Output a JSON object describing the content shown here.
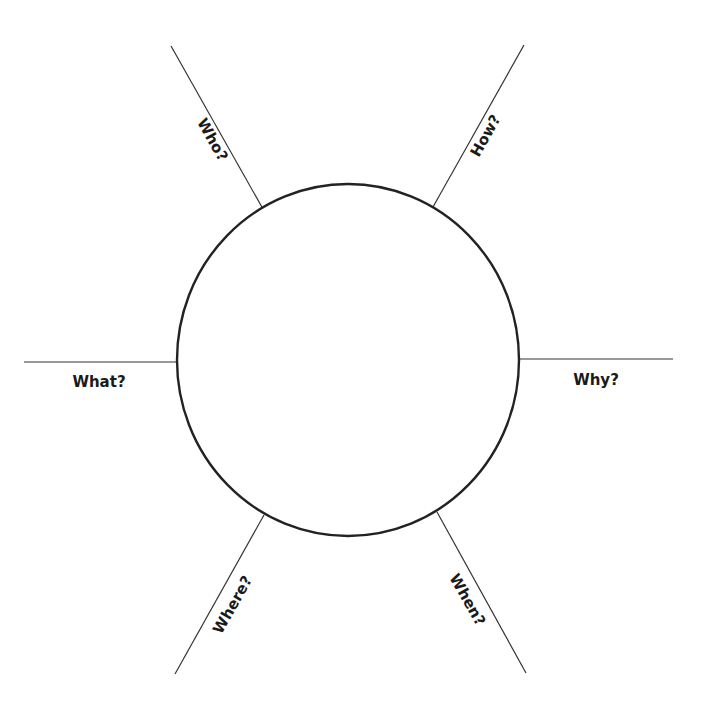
{
  "diagram": {
    "type": "five-w-one-h-organizer",
    "center": {
      "label": ""
    },
    "spokes": [
      {
        "id": "who",
        "label": "Who?"
      },
      {
        "id": "how",
        "label": "How?"
      },
      {
        "id": "what",
        "label": "What?"
      },
      {
        "id": "why",
        "label": "Why?"
      },
      {
        "id": "where",
        "label": "Where?"
      },
      {
        "id": "when",
        "label": "When?"
      }
    ]
  },
  "colors": {
    "line": "#333333",
    "circle_stroke": "#222222",
    "text": "#1a1a1a",
    "background": "#ffffff"
  }
}
